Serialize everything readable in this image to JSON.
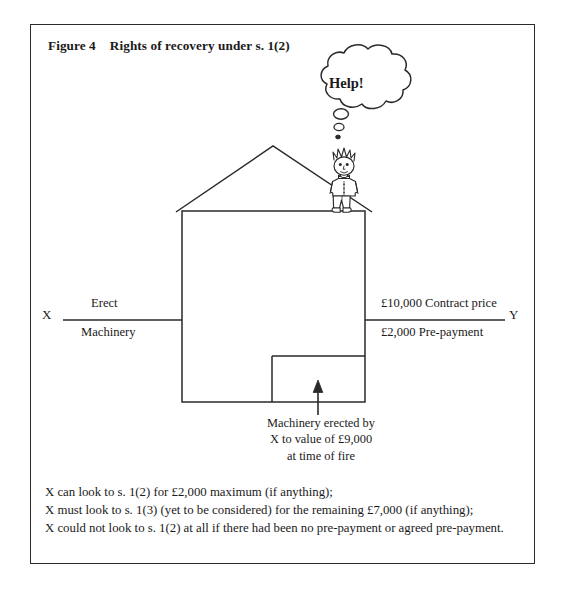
{
  "figure": {
    "number": "Figure 4",
    "title": "Rights of recovery under s. 1(2)"
  },
  "diagram": {
    "party_left": "X",
    "party_right": "Y",
    "left_line_above": "Erect",
    "left_line_below": "Machinery",
    "right_line_above": "£10,000 Contract price",
    "right_line_below": "£2,000 Pre-payment",
    "speech_bubble": "Help!",
    "arrow_caption": [
      "Machinery erected by",
      "X to value of £9,000",
      "at time of fire"
    ],
    "ink_color": "#2a2a2a",
    "background_color": "#ffffff"
  },
  "footnote": {
    "lines": [
      "X can look to s. 1(2) for £2,000 maximum (if anything);",
      "X must look to s. 1(3) (yet to be considered) for the remaining £7,000 (if anything);",
      "X could not look to s. 1(2) at all if there had been no pre-payment or agreed pre-payment."
    ]
  }
}
